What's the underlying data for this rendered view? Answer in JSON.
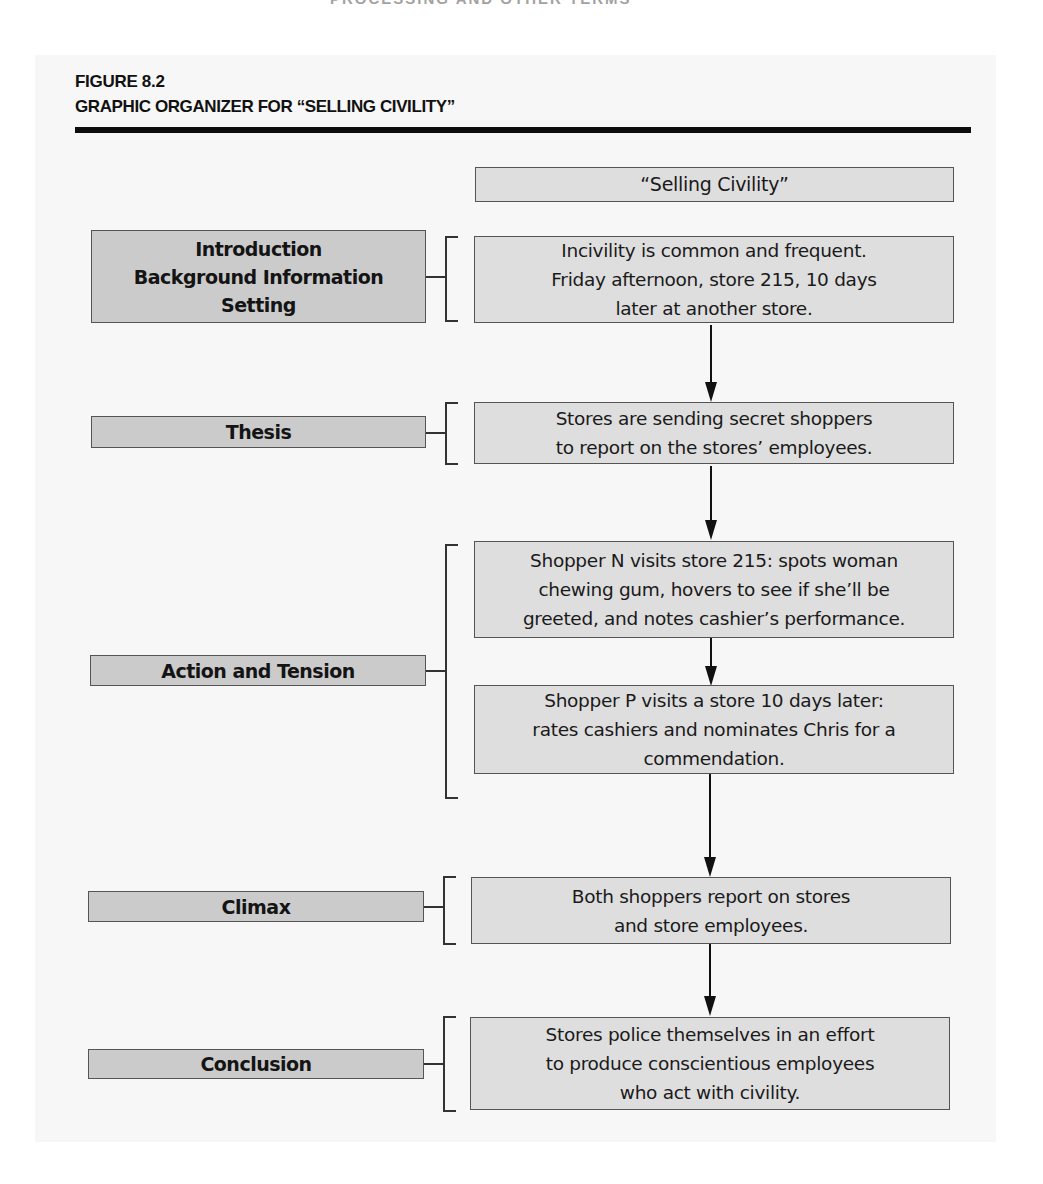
{
  "page": {
    "running_head": "PROCESSING AND OTHER TERMS"
  },
  "figure": {
    "number": "FIGURE 8.2",
    "title": "GRAPHIC ORGANIZER FOR “SELLING CIVILITY”"
  },
  "organizer": {
    "title_box": "“Selling Civility”",
    "rows": [
      {
        "label": "Introduction\nBackground Information\nSetting",
        "content": [
          "Incivility is common and frequent.\nFriday afternoon, store 215, 10 days\nlater at another store."
        ]
      },
      {
        "label": "Thesis",
        "content": [
          "Stores are sending secret shoppers\nto report on the stores’ employees."
        ]
      },
      {
        "label": "Action and Tension",
        "content": [
          "Shopper N visits store 215: spots woman\nchewing gum, hovers to see if she’ll be\ngreeted, and notes cashier’s performance.",
          "Shopper P visits a store 10 days later:\nrates cashiers and nominates Chris for a\ncommendation."
        ]
      },
      {
        "label": "Climax",
        "content": [
          "Both shoppers report on stores\nand store employees."
        ]
      },
      {
        "label": "Conclusion",
        "content": [
          "Stores police themselves in an effort\nto produce conscientious employees\nwho act with civility."
        ]
      }
    ]
  },
  "colors": {
    "label_fill": "#cbcbcb",
    "content_fill": "#dedede",
    "border": "#555555",
    "rule": "#0d0d0d",
    "page_background": "#f7f7f7"
  }
}
